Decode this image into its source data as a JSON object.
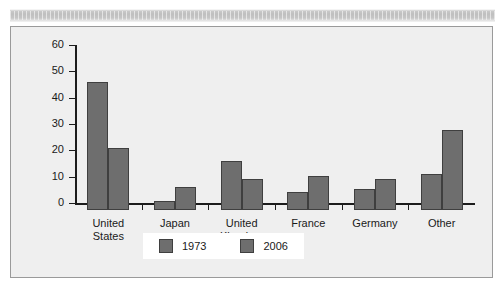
{
  "chart_data": {
    "type": "bar",
    "title": "",
    "subtitle": "",
    "xlabel": "",
    "ylabel": "",
    "ylim": [
      0,
      60
    ],
    "yticks": [
      0,
      10,
      20,
      30,
      40,
      50,
      60
    ],
    "ytick_labels": [
      "0",
      "10",
      "20",
      "30",
      "40",
      "50",
      "60"
    ],
    "grid": false,
    "legend_position": "bottom-center",
    "categories": [
      "United\nStates",
      "Japan",
      "United\nKingdom",
      "France",
      "Germany",
      "Other"
    ],
    "series": [
      {
        "name": "1973",
        "color": "#6e6e6e",
        "values": [
          48.5,
          3.3,
          18.5,
          7.0,
          8.0,
          13.7
        ]
      },
      {
        "name": "2006",
        "color": "#6e6e6e",
        "values": [
          23.6,
          8.6,
          11.8,
          12.8,
          11.8,
          30.3
        ]
      }
    ]
  },
  "legend": {
    "items": [
      {
        "label": "1973",
        "color": "#6e6e6e"
      },
      {
        "label": "2006",
        "color": "#6e6e6e"
      }
    ]
  },
  "colors": {
    "bar_fill": "#6e6e6e",
    "bar_stroke": "#3f3f3f",
    "plot_background": "#efefef",
    "frame_border": "#9a9a9a",
    "axis": "#1c1c1c",
    "text": "#1a1a1a",
    "legend_background": "#ffffff",
    "top_band": "#c3c3c3"
  }
}
